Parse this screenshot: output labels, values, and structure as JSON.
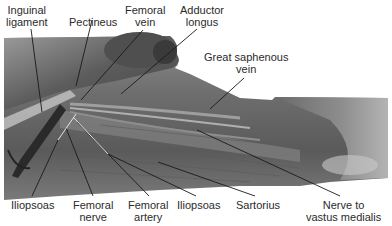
{
  "figure": {
    "type": "anatomical-dissection-photo",
    "colors": {
      "label_text": "#2b2b2b",
      "leader_line_dark": "#1a1a1a",
      "leader_line_light": "#f2f2f2",
      "background": "#ffffff"
    }
  },
  "labels_top": [
    {
      "id": "inguinal-ligament",
      "line1": "Inguinal",
      "line2": "ligament"
    },
    {
      "id": "pectineus",
      "line1": "Pectineus",
      "line2": ""
    },
    {
      "id": "femoral-vein",
      "line1": "Femoral",
      "line2": "vein"
    },
    {
      "id": "adductor-longus",
      "line1": "Adductor",
      "line2": "longus"
    },
    {
      "id": "great-saphenous-vein",
      "line1": "Great saphenous",
      "line2": "vein"
    }
  ],
  "labels_bottom": [
    {
      "id": "iliopsoas-left",
      "line1": "Iliopsoas",
      "line2": ""
    },
    {
      "id": "femoral-nerve",
      "line1": "Femoral",
      "line2": "nerve"
    },
    {
      "id": "femoral-artery",
      "line1": "Femoral",
      "line2": "artery"
    },
    {
      "id": "iliopsoas-right",
      "line1": "Iliopsoas",
      "line2": ""
    },
    {
      "id": "sartorius",
      "line1": "Sartorius",
      "line2": ""
    },
    {
      "id": "nerve-to-vastus-medialis",
      "line1": "Nerve to",
      "line2": "vastus medialis"
    }
  ]
}
